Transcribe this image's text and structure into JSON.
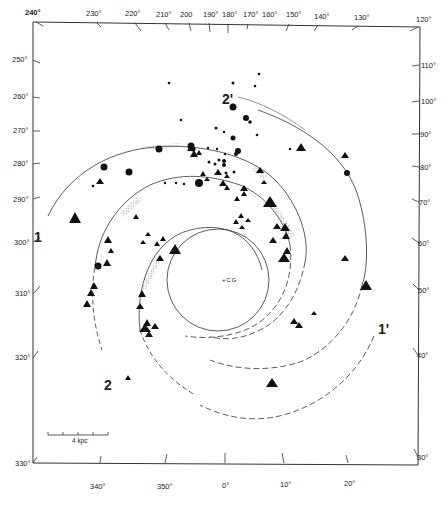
{
  "figure": {
    "title": "",
    "center_label": "+CG",
    "scale_bar": {
      "label": "4 kpc",
      "value": "4",
      "unit": "kpc"
    },
    "axes": {
      "top": [
        "240°",
        "230°",
        "220°",
        "210°",
        "200",
        "190°",
        "180°",
        "170°",
        "160°",
        "150°",
        "140°",
        "130°",
        "120°"
      ],
      "left": [
        "250°",
        "260°",
        "270°",
        "280°",
        "290°",
        "300°",
        "310°",
        "320°",
        "330°"
      ],
      "right": [
        "110°",
        "100°",
        "90°",
        "80°",
        "70°",
        "60°",
        "50°",
        "40°",
        "30°"
      ],
      "bottom": [
        "340°",
        "350°",
        "0°",
        "10°",
        "20°"
      ]
    },
    "arm_labels": {
      "arm1": "1",
      "arm1_prime": "1'",
      "arm2": "2",
      "arm2_prime": "2'"
    },
    "colors": {
      "line": "#333333",
      "marker": "#111111",
      "hatch": "#888888",
      "background": "#ffffff"
    }
  }
}
